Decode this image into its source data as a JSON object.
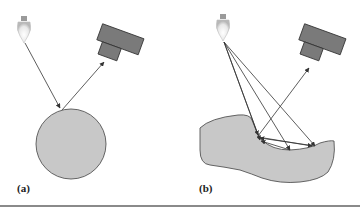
{
  "figure": {
    "panels": [
      {
        "id": "a",
        "label": "(a)",
        "description": "Single light ray from bulb reflects off sphere into camera",
        "light": {
          "x": 24,
          "y": 32
        },
        "camera": {
          "x": 105,
          "y": 45
        },
        "object": {
          "shape": "circle",
          "cx": 71,
          "cy": 144,
          "r": 35
        }
      },
      {
        "id": "b",
        "label": "(b)",
        "description": "Multiple rays from bulb interreflect on concave irregular surface before reaching camera",
        "light": {
          "x": 223,
          "y": 30
        },
        "camera": {
          "x": 330,
          "y": 50
        }
      }
    ],
    "colors": {
      "object_fill": "#c8c8c8",
      "object_stroke": "#555555",
      "camera_fill": "#7a7a7a",
      "camera_stroke": "#333333",
      "ray": "#333333",
      "rule": "#8a8a8a"
    }
  }
}
